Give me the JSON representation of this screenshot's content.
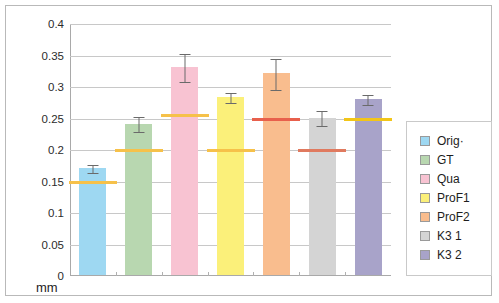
{
  "chart_data": {
    "type": "bar",
    "title": "",
    "xlabel": "mm",
    "ylabel": "",
    "ylim": [
      0,
      0.4
    ],
    "ytick_labels": [
      "0.4",
      "0.35",
      "0.3",
      "0.25",
      "0.2",
      "0.15",
      "0.1",
      "0.05",
      "0"
    ],
    "ytick_values": [
      0.4,
      0.35,
      0.3,
      0.25,
      0.2,
      0.15,
      0.1,
      0.05,
      0
    ],
    "grid": true,
    "legend_position": "right-outside",
    "categories": [
      "Orig·",
      "GT",
      "Qua",
      "ProF1",
      "ProF2",
      "K3 1",
      "K3 2"
    ],
    "values": [
      0.17,
      0.24,
      0.33,
      0.282,
      0.32,
      0.25,
      0.28
    ],
    "errors": [
      0.006,
      0.012,
      0.022,
      0.008,
      0.025,
      0.012,
      0.008
    ],
    "reference_markers": [
      0.15,
      0.2,
      0.255,
      0.2,
      0.25,
      0.2,
      0.25
    ],
    "marker_colors": [
      "#f6c14a",
      "#f6c14a",
      "#f6c14a",
      "#f6c14a",
      "#e8604c",
      "#e07a5f",
      "#f2c518"
    ],
    "bar_colors": [
      "#9ed8f2",
      "#b8d7b0",
      "#f8c3d2",
      "#fbf07a",
      "#f9bd8e",
      "#d4d4d4",
      "#a8a3c9"
    ],
    "series": [
      {
        "name": "Orig·",
        "value": 0.17,
        "error": 0.006,
        "marker": 0.15,
        "color": "#9ed8f2"
      },
      {
        "name": "GT",
        "value": 0.24,
        "error": 0.012,
        "marker": 0.2,
        "color": "#b8d7b0"
      },
      {
        "name": "Qua",
        "value": 0.33,
        "error": 0.022,
        "marker": 0.255,
        "color": "#f8c3d2"
      },
      {
        "name": "ProF1",
        "value": 0.282,
        "error": 0.008,
        "marker": 0.2,
        "color": "#fbf07a"
      },
      {
        "name": "ProF2",
        "value": 0.32,
        "error": 0.025,
        "marker": 0.25,
        "color": "#f9bd8e"
      },
      {
        "name": "K3 1",
        "value": 0.25,
        "error": 0.012,
        "marker": 0.2,
        "color": "#d4d4d4"
      },
      {
        "name": "K3 2",
        "value": 0.28,
        "error": 0.008,
        "marker": 0.25,
        "color": "#a8a3c9"
      }
    ]
  },
  "axis": {
    "x_title": "mm",
    "y_labels": [
      "0.4",
      "0.35",
      "0.3",
      "0.25",
      "0.2",
      "0.15",
      "0.1",
      "0.05",
      "0"
    ]
  },
  "legend": {
    "items": [
      {
        "label": "Orig·",
        "color": "#9ed8f2"
      },
      {
        "label": "GT",
        "color": "#b8d7b0"
      },
      {
        "label": "Qua",
        "color": "#f8c3d2"
      },
      {
        "label": "ProF1",
        "color": "#fbf07a"
      },
      {
        "label": "ProF2",
        "color": "#f9bd8e"
      },
      {
        "label": "K3 1",
        "color": "#d4d4d4"
      },
      {
        "label": "K3 2",
        "color": "#a8a3c9"
      }
    ]
  }
}
